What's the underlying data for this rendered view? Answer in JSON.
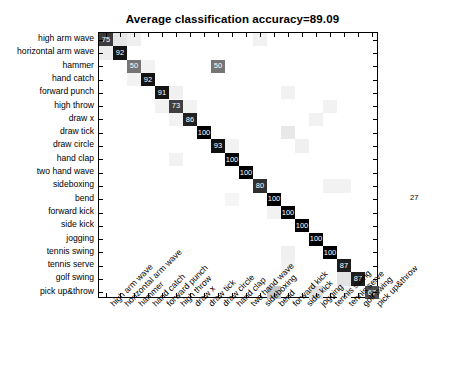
{
  "title": "Average classification accuracy=89.09",
  "chart_data": {
    "type": "heatmap",
    "title": "Average classification accuracy=89.09",
    "xlabel": "",
    "ylabel": "",
    "grid": false,
    "legend": "none",
    "colormap": "gray-inverted",
    "value_range": [
      0,
      100
    ],
    "categories": [
      "high arm wave",
      "horizontal arm wave",
      "hammer",
      "hand catch",
      "forward punch",
      "high throw",
      "draw x",
      "draw tick",
      "draw circle",
      "hand clap",
      "two hand wave",
      "sideboxing",
      "bend",
      "forward kick",
      "side kick",
      "jogging",
      "tennis swing",
      "tennis serve",
      "golf swing",
      "pick up&throw"
    ],
    "x_tick_labels": [
      "high arm wave",
      "horizontal arm wave",
      "hammer",
      "hand catch",
      "forward punch",
      "high throw",
      "draw x",
      "draw tick",
      "draw circle",
      "hand clap",
      "two hand wave",
      "sideboxing",
      "bend",
      "forward kick",
      "side kick",
      "jogging",
      "tennis swing",
      "tennis serve",
      "golf swing",
      "pick up&throw"
    ],
    "diagonal_values": [
      75,
      92,
      50,
      92,
      91,
      73,
      86,
      100,
      93,
      100,
      100,
      80,
      100,
      100,
      100,
      100,
      100,
      87,
      87,
      67
    ],
    "annotations_outside": [
      {
        "text": "27",
        "row": 12,
        "side": "right"
      }
    ],
    "labeled_cells": [
      {
        "row": 0,
        "col": 0,
        "value": 75,
        "label": "75"
      },
      {
        "row": 1,
        "col": 1,
        "value": 92,
        "label": "92"
      },
      {
        "row": 2,
        "col": 2,
        "value": 50,
        "label": "50"
      },
      {
        "row": 2,
        "col": 8,
        "value": 50,
        "label": "50"
      },
      {
        "row": 3,
        "col": 3,
        "value": 92,
        "label": "92"
      },
      {
        "row": 4,
        "col": 4,
        "value": 91,
        "label": "91"
      },
      {
        "row": 5,
        "col": 5,
        "value": 73,
        "label": "73"
      },
      {
        "row": 6,
        "col": 6,
        "value": 86,
        "label": "86"
      },
      {
        "row": 7,
        "col": 7,
        "value": 100,
        "label": "100"
      },
      {
        "row": 8,
        "col": 8,
        "value": 93,
        "label": "93"
      },
      {
        "row": 9,
        "col": 9,
        "value": 100,
        "label": "100"
      },
      {
        "row": 10,
        "col": 10,
        "value": 100,
        "label": "100"
      },
      {
        "row": 11,
        "col": 11,
        "value": 80,
        "label": "80"
      },
      {
        "row": 12,
        "col": 12,
        "value": 100,
        "label": "100"
      },
      {
        "row": 13,
        "col": 13,
        "value": 100,
        "label": "100"
      },
      {
        "row": 14,
        "col": 14,
        "value": 100,
        "label": "100"
      },
      {
        "row": 15,
        "col": 15,
        "value": 100,
        "label": "100"
      },
      {
        "row": 16,
        "col": 16,
        "value": 100,
        "label": "100"
      },
      {
        "row": 17,
        "col": 17,
        "value": 87,
        "label": "87"
      },
      {
        "row": 18,
        "col": 18,
        "value": 87,
        "label": "87"
      },
      {
        "row": 19,
        "col": 19,
        "value": 67,
        "label": "67"
      }
    ],
    "faint_cells": [
      {
        "row": 0,
        "col": 1,
        "shade": 0.1
      },
      {
        "row": 0,
        "col": 2,
        "shade": 0.06
      },
      {
        "row": 1,
        "col": 0,
        "shade": 0.07
      },
      {
        "row": 2,
        "col": 3,
        "shade": 0.05
      },
      {
        "row": 3,
        "col": 2,
        "shade": 0.05
      },
      {
        "row": 4,
        "col": 5,
        "shade": 0.06
      },
      {
        "row": 5,
        "col": 4,
        "shade": 0.05
      },
      {
        "row": 5,
        "col": 6,
        "shade": 0.05
      },
      {
        "row": 6,
        "col": 5,
        "shade": 0.05
      },
      {
        "row": 0,
        "col": 11,
        "shade": 0.05
      },
      {
        "row": 4,
        "col": 13,
        "shade": 0.05
      },
      {
        "row": 5,
        "col": 16,
        "shade": 0.05
      },
      {
        "row": 7,
        "col": 13,
        "shade": 0.09
      },
      {
        "row": 8,
        "col": 14,
        "shade": 0.06
      },
      {
        "row": 8,
        "col": 9,
        "shade": 0.05
      },
      {
        "row": 6,
        "col": 15,
        "shade": 0.05
      },
      {
        "row": 11,
        "col": 16,
        "shade": 0.05
      },
      {
        "row": 11,
        "col": 17,
        "shade": 0.05
      },
      {
        "row": 16,
        "col": 13,
        "shade": 0.06
      },
      {
        "row": 17,
        "col": 13,
        "shade": 0.05
      },
      {
        "row": 18,
        "col": 18,
        "shade": 0.0
      },
      {
        "row": 18,
        "col": 17,
        "shade": 0.11
      },
      {
        "row": 19,
        "col": 12,
        "shade": 0.22
      },
      {
        "row": 19,
        "col": 15,
        "shade": 0.12
      },
      {
        "row": 19,
        "col": 17,
        "shade": 0.05
      },
      {
        "row": 13,
        "col": 12,
        "shade": 0.05
      },
      {
        "row": 9,
        "col": 5,
        "shade": 0.05
      },
      {
        "row": 12,
        "col": 9,
        "shade": 0.04
      }
    ]
  },
  "colors": {
    "axis": "#000000",
    "text": "#000000",
    "background": "#ffffff",
    "cell_dark": "#000000",
    "cell_text_light": "#ffffff",
    "cell_text_dark": "#000000"
  }
}
